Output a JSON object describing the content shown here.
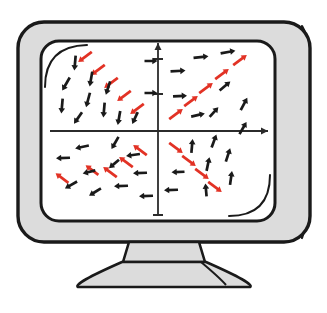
{
  "illustration": {
    "title": "Computer monitor displaying a saddle-point direction field",
    "device": "crt-monitor",
    "screen_content": "vector-field-phase-portrait"
  },
  "palette": {
    "outline": "#1a1a1a",
    "bezel_fill": "#dcdcdc",
    "bezel_shadow": "#c9c9c9",
    "screen_fill": "#ffffff",
    "stand_fill": "#dcdcdc",
    "axis": "#2b2b2b",
    "arrow_black": "#1a1a1a",
    "arrow_red": "#e23225",
    "page_background": "#ffffff"
  },
  "monitor": {
    "bezel": {
      "x": 18,
      "y": 22,
      "width": 292,
      "height": 220,
      "radius": 26
    },
    "screen": {
      "x": 41,
      "y": 41,
      "width": 234,
      "height": 180,
      "radius": 18
    },
    "side_panel_line_1_x": 297,
    "side_panel_line_2_x": 303,
    "highlight_arc_top_left": true,
    "highlight_arc_bottom_right": true,
    "neck": {
      "top_y": 242,
      "bottom_y": 262,
      "top_half_width": 35,
      "bottom_half_width": 41
    },
    "base": {
      "center_x": 164,
      "top_y": 262,
      "bottom_y": 287,
      "top_half_width": 42,
      "bottom_half_width": 92
    }
  },
  "chart_data": {
    "type": "scatter",
    "subtitle": "Arrows show dx/dt, dy/dt; red arrows lie on the eigendirections y = x and y = -x",
    "xlabel": "x",
    "ylabel": "y",
    "xlim": [
      -100,
      100
    ],
    "ylim": [
      -100,
      100
    ],
    "grid": false,
    "legend": null,
    "axes": {
      "origin_px": {
        "x": 158,
        "y": 131
      },
      "x_axis": {
        "x1": 50,
        "x2": 268,
        "y": 131,
        "arrowhead": "right"
      },
      "y_axis": {
        "y1": 43,
        "y2": 215,
        "x": 158,
        "arrowhead": "up"
      },
      "tick_marks_on_y_axis_px": [
        59,
        94,
        215
      ]
    },
    "eigendirections": [
      {
        "name": "unstable",
        "slope": 1,
        "color": "#e23225",
        "flow": "outward-from-origin"
      },
      {
        "name": "stable",
        "slope": -1,
        "color": "#e23225",
        "flow": "inward-to-origin"
      }
    ],
    "arrows": [
      {
        "x": 85,
        "y": 57,
        "angle": 143,
        "color": "red",
        "len": 17
      },
      {
        "x": 98,
        "y": 70,
        "angle": 143,
        "color": "red",
        "len": 17
      },
      {
        "x": 111,
        "y": 83,
        "angle": 143,
        "color": "red",
        "len": 17
      },
      {
        "x": 124,
        "y": 96,
        "angle": 143,
        "color": "red",
        "len": 17
      },
      {
        "x": 137,
        "y": 109,
        "angle": 143,
        "color": "red",
        "len": 17
      },
      {
        "x": 176,
        "y": 114,
        "angle": -37,
        "color": "red",
        "len": 17
      },
      {
        "x": 191,
        "y": 101,
        "angle": -37,
        "color": "red",
        "len": 17
      },
      {
        "x": 206,
        "y": 88,
        "angle": -37,
        "color": "red",
        "len": 17
      },
      {
        "x": 222,
        "y": 74,
        "angle": -37,
        "color": "red",
        "len": 17
      },
      {
        "x": 240,
        "y": 60,
        "angle": -37,
        "color": "red",
        "len": 17
      },
      {
        "x": 140,
        "y": 150,
        "angle": -143,
        "color": "red",
        "len": 17
      },
      {
        "x": 126,
        "y": 162,
        "angle": -143,
        "color": "red",
        "len": 17
      },
      {
        "x": 110,
        "y": 172,
        "angle": -143,
        "color": "red",
        "len": 17
      },
      {
        "x": 92,
        "y": 170,
        "angle": -143,
        "color": "red",
        "len": 16
      },
      {
        "x": 62,
        "y": 178,
        "angle": -143,
        "color": "red",
        "len": 16
      },
      {
        "x": 176,
        "y": 148,
        "angle": 37,
        "color": "red",
        "len": 17
      },
      {
        "x": 189,
        "y": 161,
        "angle": 37,
        "color": "red",
        "len": 17
      },
      {
        "x": 202,
        "y": 174,
        "angle": 37,
        "color": "red",
        "len": 17
      },
      {
        "x": 215,
        "y": 187,
        "angle": 37,
        "color": "red",
        "len": 17
      },
      {
        "x": 75,
        "y": 63,
        "angle": 95,
        "color": "black",
        "len": 15
      },
      {
        "x": 91,
        "y": 79,
        "angle": 100,
        "color": "black",
        "len": 15
      },
      {
        "x": 66,
        "y": 84,
        "angle": 120,
        "color": "black",
        "len": 15
      },
      {
        "x": 88,
        "y": 100,
        "angle": 105,
        "color": "black",
        "len": 15
      },
      {
        "x": 62,
        "y": 106,
        "angle": 95,
        "color": "black",
        "len": 15
      },
      {
        "x": 78,
        "y": 118,
        "angle": 125,
        "color": "black",
        "len": 14
      },
      {
        "x": 104,
        "y": 110,
        "angle": 95,
        "color": "black",
        "len": 15
      },
      {
        "x": 119,
        "y": 118,
        "angle": 100,
        "color": "black",
        "len": 14
      },
      {
        "x": 108,
        "y": 88,
        "angle": 108,
        "color": "black",
        "len": 14
      },
      {
        "x": 135,
        "y": 118,
        "angle": 115,
        "color": "black",
        "len": 13
      },
      {
        "x": 151,
        "y": 61,
        "angle": 0,
        "color": "black",
        "len": 13
      },
      {
        "x": 151,
        "y": 93,
        "angle": 0,
        "color": "black",
        "len": 13
      },
      {
        "x": 178,
        "y": 71,
        "angle": -3,
        "color": "black",
        "len": 15
      },
      {
        "x": 180,
        "y": 96,
        "angle": -3,
        "color": "black",
        "len": 14
      },
      {
        "x": 201,
        "y": 57,
        "angle": -6,
        "color": "black",
        "len": 15
      },
      {
        "x": 198,
        "y": 115,
        "angle": -13,
        "color": "black",
        "len": 14
      },
      {
        "x": 228,
        "y": 52,
        "angle": -10,
        "color": "black",
        "len": 15
      },
      {
        "x": 225,
        "y": 86,
        "angle": -40,
        "color": "black",
        "len": 14
      },
      {
        "x": 244,
        "y": 104,
        "angle": -62,
        "color": "black",
        "len": 14
      },
      {
        "x": 214,
        "y": 112,
        "angle": -48,
        "color": "black",
        "len": 13
      },
      {
        "x": 82,
        "y": 147,
        "angle": 168,
        "color": "black",
        "len": 14
      },
      {
        "x": 63,
        "y": 158,
        "angle": 178,
        "color": "black",
        "len": 14
      },
      {
        "x": 89,
        "y": 172,
        "angle": 166,
        "color": "black",
        "len": 13
      },
      {
        "x": 71,
        "y": 185,
        "angle": 150,
        "color": "black",
        "len": 14
      },
      {
        "x": 95,
        "y": 192,
        "angle": 148,
        "color": "black",
        "len": 14
      },
      {
        "x": 115,
        "y": 143,
        "angle": 120,
        "color": "black",
        "len": 14
      },
      {
        "x": 114,
        "y": 164,
        "angle": 140,
        "color": "black",
        "len": 13
      },
      {
        "x": 121,
        "y": 186,
        "angle": 178,
        "color": "black",
        "len": 14
      },
      {
        "x": 133,
        "y": 155,
        "angle": 172,
        "color": "black",
        "len": 14
      },
      {
        "x": 140,
        "y": 173,
        "angle": 178,
        "color": "black",
        "len": 14
      },
      {
        "x": 146,
        "y": 196,
        "angle": 178,
        "color": "black",
        "len": 14
      },
      {
        "x": 171,
        "y": 190,
        "angle": 178,
        "color": "black",
        "len": 14
      },
      {
        "x": 178,
        "y": 172,
        "angle": 178,
        "color": "black",
        "len": 13
      },
      {
        "x": 192,
        "y": 146,
        "angle": -85,
        "color": "black",
        "len": 14
      },
      {
        "x": 208,
        "y": 164,
        "angle": -78,
        "color": "black",
        "len": 14
      },
      {
        "x": 214,
        "y": 141,
        "angle": -70,
        "color": "black",
        "len": 14
      },
      {
        "x": 228,
        "y": 155,
        "angle": -72,
        "color": "black",
        "len": 14
      },
      {
        "x": 231,
        "y": 178,
        "angle": -82,
        "color": "black",
        "len": 14
      },
      {
        "x": 206,
        "y": 190,
        "angle": -95,
        "color": "black",
        "len": 13
      },
      {
        "x": 243,
        "y": 128,
        "angle": -60,
        "color": "black",
        "len": 14
      }
    ]
  }
}
